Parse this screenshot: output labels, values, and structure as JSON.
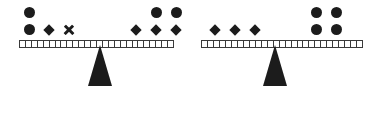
{
  "scene": {
    "title": "two-pan-balance-puzzle",
    "background_color": "#ffffff",
    "ink_color": "#1c1c1c",
    "beam_color": "#3a3a3a"
  },
  "balances": [
    {
      "id": "balance-left",
      "name": "left-balance",
      "state": "level",
      "beam": {
        "x": 19,
        "y": 40,
        "width": 155,
        "height": 8,
        "segments": 26
      },
      "fulcrum": {
        "cx": 100,
        "top": 45,
        "width": 24,
        "height": 41
      },
      "pans": [
        {
          "side": "left",
          "name": "left-pan",
          "x": 19,
          "y": 4,
          "rows": [
            {
              "cells": [
                "circle",
                "",
                ""
              ]
            },
            {
              "cells": [
                "circle",
                "diamond",
                "cross"
              ]
            }
          ],
          "counts": {
            "circle": 2,
            "diamond": 1,
            "cross": 1
          }
        },
        {
          "side": "right",
          "name": "right-pan",
          "x": 126,
          "y": 4,
          "rows": [
            {
              "cells": [
                "",
                "circle",
                "circle"
              ]
            },
            {
              "cells": [
                "diamond",
                "diamond",
                "diamond"
              ]
            }
          ],
          "counts": {
            "circle": 2,
            "diamond": 3,
            "cross": 0
          }
        }
      ]
    },
    {
      "id": "balance-right",
      "name": "right-balance",
      "state": "level",
      "beam": {
        "x": 13,
        "y": 40,
        "width": 162,
        "height": 8,
        "segments": 27
      },
      "fulcrum": {
        "cx": 87,
        "top": 45,
        "width": 24,
        "height": 41
      },
      "pans": [
        {
          "side": "left",
          "name": "left-pan",
          "x": 17,
          "y": 21,
          "rows": [
            {
              "cells": [
                "diamond",
                "diamond",
                "diamond"
              ]
            }
          ],
          "counts": {
            "circle": 0,
            "diamond": 3,
            "cross": 0
          }
        },
        {
          "side": "right",
          "name": "right-pan",
          "x": 118,
          "y": 4,
          "rows": [
            {
              "cells": [
                "circle",
                "circle"
              ]
            },
            {
              "cells": [
                "circle",
                "circle"
              ]
            }
          ],
          "counts": {
            "circle": 4,
            "diamond": 0,
            "cross": 0
          }
        }
      ]
    }
  ]
}
